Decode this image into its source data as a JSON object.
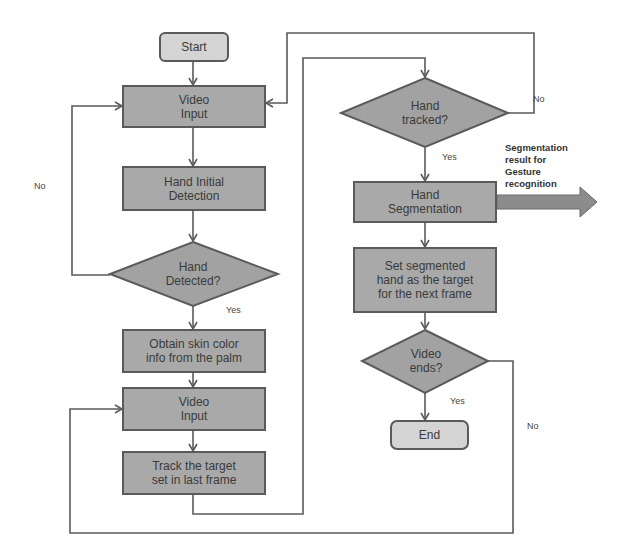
{
  "diagram": {
    "type": "flowchart",
    "colors": {
      "process_fill": "#a9a9a9",
      "terminal_fill": "#d4d4d4",
      "decision_fill": "#a2a2a2",
      "stroke": "#5a5a5a",
      "text": "#3a3a3a"
    },
    "nodes": {
      "start": {
        "label": "Start"
      },
      "video_input_1": {
        "label_line1": "Video",
        "label_line2": "Input"
      },
      "hand_initial_detection": {
        "label_line1": "Hand Initial",
        "label_line2": "Detection"
      },
      "hand_detected": {
        "label_line1": "Hand",
        "label_line2": "Detected?"
      },
      "obtain_skin_color": {
        "label_line1": "Obtain skin color",
        "label_line2": "info from the palm"
      },
      "video_input_2": {
        "label_line1": "Video",
        "label_line2": "Input"
      },
      "track_target": {
        "label_line1": "Track the target",
        "label_line2": "set in last frame"
      },
      "hand_tracked": {
        "label_line1": "Hand",
        "label_line2": "tracked?"
      },
      "hand_segmentation": {
        "label_line1": "Hand",
        "label_line2": "Segmentation"
      },
      "set_segmented": {
        "label_line1": "Set segmented",
        "label_line2": "hand as the target",
        "label_line3": "for the next frame"
      },
      "video_ends": {
        "label_line1": "Video",
        "label_line2": "ends?"
      },
      "end": {
        "label": "End"
      }
    },
    "edge_labels": {
      "hand_detected_no": "No",
      "hand_detected_yes": "Yes",
      "hand_tracked_no": "No",
      "hand_tracked_yes": "Yes",
      "video_ends_yes": "Yes",
      "video_ends_no": "No"
    },
    "output_note": {
      "line1": "Segmentation",
      "line2": "result for",
      "line3": "Gesture",
      "line4": "recognition"
    },
    "edges": [
      [
        "start",
        "video_input_1"
      ],
      [
        "video_input_1",
        "hand_initial_detection"
      ],
      [
        "hand_initial_detection",
        "hand_detected"
      ],
      [
        "hand_detected",
        "video_input_1",
        "No"
      ],
      [
        "hand_detected",
        "obtain_skin_color",
        "Yes"
      ],
      [
        "obtain_skin_color",
        "video_input_2"
      ],
      [
        "video_input_2",
        "track_target"
      ],
      [
        "track_target",
        "hand_tracked"
      ],
      [
        "hand_tracked",
        "video_input_1",
        "No"
      ],
      [
        "hand_tracked",
        "hand_segmentation",
        "Yes"
      ],
      [
        "hand_segmentation",
        "gesture_recognition_output"
      ],
      [
        "hand_segmentation",
        "set_segmented"
      ],
      [
        "set_segmented",
        "video_ends"
      ],
      [
        "video_ends",
        "end",
        "Yes"
      ],
      [
        "video_ends",
        "video_input_2",
        "No"
      ]
    ]
  }
}
